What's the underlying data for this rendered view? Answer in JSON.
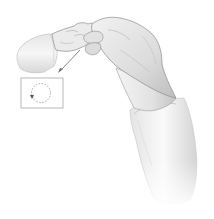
{
  "figure": {
    "inset": {
      "shape": "circular dashed motion path",
      "arrow_direction": "counter-clockwise",
      "border_color": "#9a9a9a",
      "path_color": "#8a8a8a"
    },
    "pointer_line_color": "#7a7a7a",
    "palette": {
      "background": "#ffffff",
      "skin_light": "#f1f1f1",
      "skin_mid": "#d6d6d6",
      "skin_shadow": "#a8a8a8",
      "outline": "#8c8c8c",
      "sleeve_light": "#f6f6f6",
      "sleeve_shadow": "#cfcfcf"
    }
  }
}
